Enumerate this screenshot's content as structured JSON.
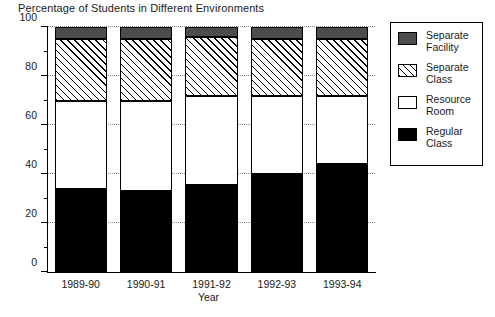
{
  "chart_data": {
    "type": "bar",
    "subtype": "stacked-bar-100-percent",
    "title": "Percentage of Students in Different Environments",
    "xlabel": "Year",
    "ylabel": "",
    "ylim": [
      0,
      100
    ],
    "ytick_values": [
      0,
      20,
      40,
      60,
      80,
      100
    ],
    "ytick_labels": [
      "0",
      "20",
      "40",
      "60",
      "80",
      "100"
    ],
    "yminor_values": [
      10,
      30,
      50,
      70,
      90
    ],
    "grid": "horizontal-dotted",
    "legend_position": "right",
    "categories": [
      "1989-90",
      "1990-91",
      "1991-92",
      "1992-93",
      "1993-94"
    ],
    "series": [
      {
        "name": "Regular Class",
        "key": "regular",
        "color": "#000000",
        "pattern": "solid-black",
        "values": [
          34,
          33,
          35.5,
          40,
          44
        ]
      },
      {
        "name": "Resource Room",
        "key": "resource",
        "color": "#ffffff",
        "pattern": "solid-white",
        "values": [
          36,
          37,
          36.5,
          32,
          28
        ]
      },
      {
        "name": "Separate Class",
        "key": "separate",
        "color": "#ffffff",
        "pattern": "diagonal-hatch",
        "values": [
          25,
          25,
          24,
          23,
          23
        ]
      },
      {
        "name": "Separate Facility",
        "key": "facility",
        "color": "#4d4d4d",
        "pattern": "solid-gray",
        "values": [
          5,
          5,
          4,
          5,
          5
        ]
      }
    ],
    "cumulative_tops": [
      {
        "category": "1989-90",
        "regular": 34,
        "resource": 70,
        "separate": 95,
        "facility": 100
      },
      {
        "category": "1990-91",
        "regular": 33,
        "resource": 70,
        "separate": 95,
        "facility": 100
      },
      {
        "category": "1991-92",
        "regular": 35.5,
        "resource": 72,
        "separate": 96,
        "facility": 100
      },
      {
        "category": "1992-93",
        "regular": 40,
        "resource": 72,
        "separate": 95,
        "facility": 100
      },
      {
        "category": "1993-94",
        "regular": 44,
        "resource": 72,
        "separate": 95,
        "facility": 100
      }
    ]
  },
  "legend": {
    "items": [
      {
        "line1": "Separate",
        "line2": "Facility",
        "key": "facility"
      },
      {
        "line1": "Separate",
        "line2": "Class",
        "key": "separate"
      },
      {
        "line1": "Resource",
        "line2": "Room",
        "key": "resource"
      },
      {
        "line1": "Regular",
        "line2": "Class",
        "key": "regular"
      }
    ]
  }
}
